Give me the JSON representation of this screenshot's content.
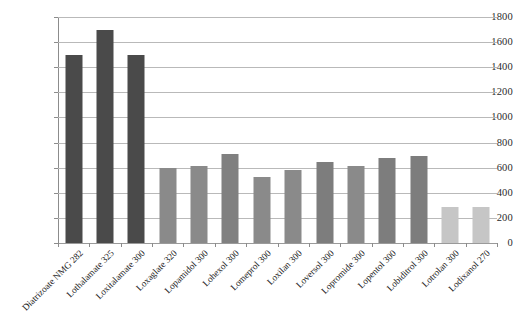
{
  "chart_data": {
    "type": "bar",
    "title": "",
    "subtitle": "",
    "xlabel": "",
    "ylabel": "",
    "ylim": [
      0,
      1800
    ],
    "ytick_step": 200,
    "yticks": [
      0,
      200,
      400,
      600,
      800,
      1000,
      1200,
      1400,
      1600,
      1800
    ],
    "grid": true,
    "legend": "none",
    "categories": [
      "Diatrizoate NMG 282",
      "Lothalamate 325",
      "Loxitalamate 300",
      "Loxaglate 320",
      "Lopamidol 300",
      "Lohexol 300",
      "Lomeprol 300",
      "Loxilan 300",
      "Loversol 300",
      "Lopromide 300",
      "Lopentol 300",
      "Lobiditrol 300",
      "Lotrolan 300",
      "Lodixanol 270"
    ],
    "values": [
      1500,
      1700,
      1500,
      600,
      615,
      710,
      525,
      580,
      645,
      610,
      680,
      690,
      290,
      290
    ],
    "bar_colors": [
      "#4a4a4a",
      "#4a4a4a",
      "#4a4a4a",
      "#8a8a8a",
      "#8a8a8a",
      "#808080",
      "#8a8a8a",
      "#8a8a8a",
      "#7d7d7d",
      "#8a8a8a",
      "#7d7d7d",
      "#7d7d7d",
      "#c6c6c6",
      "#c6c6c6"
    ]
  },
  "colors": {
    "background": "#ffffff",
    "gridline": "#b9b9b9",
    "axis": "#8c8c8c",
    "text": "#232323",
    "group_dark": "#4a4a4a",
    "group_medium": "#808080",
    "group_light": "#c6c6c6"
  }
}
